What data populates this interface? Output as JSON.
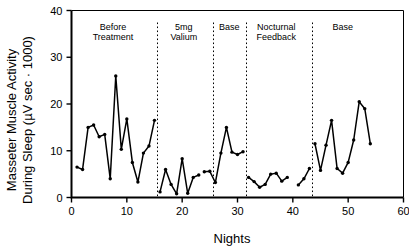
{
  "chart_data": {
    "type": "line",
    "title": "",
    "xlabel": "Nights",
    "ylabel": "Masseter Muscle Activity During Sleep (µV sec · 1000)",
    "ylabel_line1": "Masseter Muscle Activity",
    "ylabel_line2": "During Sleep (µV sec · 1000)",
    "xlim": [
      0,
      60
    ],
    "ylim": [
      0,
      40
    ],
    "xticks": [
      0,
      10,
      20,
      30,
      40,
      50,
      60
    ],
    "yticks": [
      0,
      10,
      20,
      30,
      40
    ],
    "grid": false,
    "legend": "none",
    "marker": "filled-circle",
    "line_color": "#000000",
    "series": [
      {
        "name": "Before Treatment",
        "x": [
          1,
          2,
          3,
          4,
          5,
          6,
          7,
          8,
          9,
          10,
          11,
          12,
          13,
          14,
          15
        ],
        "values": [
          6.5,
          6.0,
          15.0,
          15.5,
          13.0,
          13.5,
          4.0,
          26.0,
          10.3,
          16.8,
          7.5,
          3.3,
          9.5,
          11.0,
          16.5
        ]
      },
      {
        "name": "5mg Valium",
        "x": [
          16,
          17,
          18,
          19,
          20,
          21,
          22,
          23
        ],
        "values": [
          1.2,
          6.0,
          2.8,
          0.8,
          8.3,
          0.9,
          4.3,
          4.8
        ]
      },
      {
        "name": "Base",
        "x": [
          24,
          25,
          26,
          27,
          28,
          29,
          30,
          31
        ],
        "values": [
          5.5,
          5.6,
          3.2,
          9.5,
          15.0,
          9.7,
          9.2,
          9.8
        ]
      },
      {
        "name": "Nocturnal Feedback",
        "x": [
          32,
          33,
          34,
          35,
          36,
          37,
          38,
          39,
          41,
          42,
          43
        ],
        "values": [
          4.3,
          3.4,
          2.2,
          2.8,
          5.0,
          5.2,
          3.5,
          4.3,
          2.7,
          4.0,
          6.2
        ]
      },
      {
        "name": "Base",
        "x": [
          44,
          45,
          46,
          47,
          48,
          49,
          50,
          51,
          52,
          53,
          54
        ],
        "values": [
          11.5,
          5.8,
          11.2,
          16.5,
          6.2,
          5.2,
          7.5,
          12.3,
          20.5,
          19.0,
          11.5
        ]
      }
    ],
    "dividers": [
      15.5,
      25.5,
      31.5,
      43.5
    ],
    "segment_labels": [
      {
        "text_line1": "Before",
        "text_line2": "Treatment",
        "center_x": 7.5
      },
      {
        "text_line1": "5mg",
        "text_line2": "Valium",
        "center_x": 20.3
      },
      {
        "text_line1": "Base",
        "text_line2": "",
        "center_x": 28.5
      },
      {
        "text_line1": "Nocturnal",
        "text_line2": "Feedback",
        "center_x": 37.0
      },
      {
        "text_line1": "Base",
        "text_line2": "",
        "center_x": 49.0
      }
    ]
  }
}
